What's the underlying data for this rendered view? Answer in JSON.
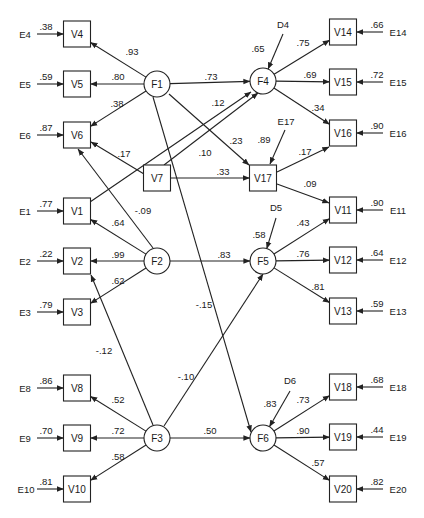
{
  "diagram": {
    "type": "structural-equation-path-diagram",
    "latent_factors": [
      "F1",
      "F2",
      "F3",
      "F4",
      "F5",
      "F6"
    ],
    "observed": [
      "V1",
      "V2",
      "V3",
      "V4",
      "V5",
      "V6",
      "V7",
      "V8",
      "V9",
      "V10",
      "V11",
      "V12",
      "V13",
      "V14",
      "V15",
      "V16",
      "V17",
      "V18",
      "V19",
      "V20"
    ],
    "nodes": [
      {
        "id": "F1",
        "shape": "circle"
      },
      {
        "id": "F2",
        "shape": "circle"
      },
      {
        "id": "F3",
        "shape": "circle"
      },
      {
        "id": "F4",
        "shape": "circle"
      },
      {
        "id": "F5",
        "shape": "circle"
      },
      {
        "id": "F6",
        "shape": "circle"
      },
      {
        "id": "V4",
        "shape": "box"
      },
      {
        "id": "V5",
        "shape": "box"
      },
      {
        "id": "V6",
        "shape": "box"
      },
      {
        "id": "V1",
        "shape": "box"
      },
      {
        "id": "V2",
        "shape": "box"
      },
      {
        "id": "V3",
        "shape": "box"
      },
      {
        "id": "V8",
        "shape": "box"
      },
      {
        "id": "V9",
        "shape": "box"
      },
      {
        "id": "V10",
        "shape": "box"
      },
      {
        "id": "V7",
        "shape": "box"
      },
      {
        "id": "V17",
        "shape": "box"
      },
      {
        "id": "V14",
        "shape": "box"
      },
      {
        "id": "V15",
        "shape": "box"
      },
      {
        "id": "V16",
        "shape": "box"
      },
      {
        "id": "V11",
        "shape": "box"
      },
      {
        "id": "V12",
        "shape": "box"
      },
      {
        "id": "V13",
        "shape": "box"
      },
      {
        "id": "V18",
        "shape": "box"
      },
      {
        "id": "V19",
        "shape": "box"
      },
      {
        "id": "V20",
        "shape": "box"
      }
    ],
    "paths": [
      {
        "from": "F1",
        "to": "V4",
        "coef": ".93"
      },
      {
        "from": "F1",
        "to": "V5",
        "coef": ".80"
      },
      {
        "from": "F1",
        "to": "V6",
        "coef": ".38"
      },
      {
        "from": "F1",
        "to": "F4",
        "coef": ".73"
      },
      {
        "from": "F1",
        "to": "V17",
        "coef": ".23"
      },
      {
        "from": "F1",
        "to": "F6",
        "coef": "-.15"
      },
      {
        "from": "V1",
        "to": "F4",
        "coef": ".12"
      },
      {
        "from": "V7",
        "to": "F4",
        "coef": ".10"
      },
      {
        "from": "V7",
        "to": "V6",
        "coef": ".17"
      },
      {
        "from": "V7",
        "to": "V17",
        "coef": ".33"
      },
      {
        "from": "F2",
        "to": "V6",
        "coef": "-.09"
      },
      {
        "from": "F2",
        "to": "V1",
        "coef": ".64"
      },
      {
        "from": "F2",
        "to": "V2",
        "coef": ".99"
      },
      {
        "from": "F2",
        "to": "V3",
        "coef": ".62"
      },
      {
        "from": "F2",
        "to": "F5",
        "coef": ".83"
      },
      {
        "from": "F3",
        "to": "V2",
        "coef": "-.12"
      },
      {
        "from": "F3",
        "to": "F5",
        "coef": "-.10"
      },
      {
        "from": "F3",
        "to": "V8",
        "coef": ".52"
      },
      {
        "from": "F3",
        "to": "V9",
        "coef": ".72"
      },
      {
        "from": "F3",
        "to": "V10",
        "coef": ".58"
      },
      {
        "from": "F3",
        "to": "F6",
        "coef": ".50"
      },
      {
        "from": "F4",
        "to": "V14",
        "coef": ".75"
      },
      {
        "from": "F4",
        "to": "V15",
        "coef": ".69"
      },
      {
        "from": "F4",
        "to": "V16",
        "coef": ".34"
      },
      {
        "from": "V17",
        "to": "V16",
        "coef": ".17"
      },
      {
        "from": "V17",
        "to": "V11",
        "coef": ".09"
      },
      {
        "from": "F5",
        "to": "V11",
        "coef": ".43"
      },
      {
        "from": "F5",
        "to": "V12",
        "coef": ".76"
      },
      {
        "from": "F5",
        "to": "V13",
        "coef": ".81"
      },
      {
        "from": "F6",
        "to": "V18",
        "coef": ".73"
      },
      {
        "from": "F6",
        "to": "V19",
        "coef": ".90"
      },
      {
        "from": "F6",
        "to": "V20",
        "coef": ".57"
      }
    ],
    "errors": [
      {
        "id": "E4",
        "to": "V4",
        "coef": ".38"
      },
      {
        "id": "E5",
        "to": "V5",
        "coef": ".59"
      },
      {
        "id": "E6",
        "to": "V6",
        "coef": ".87"
      },
      {
        "id": "E1",
        "to": "V1",
        "coef": ".77"
      },
      {
        "id": "E2",
        "to": "V2",
        "coef": ".22"
      },
      {
        "id": "E3",
        "to": "V3",
        "coef": ".79"
      },
      {
        "id": "E8",
        "to": "V8",
        "coef": ".86"
      },
      {
        "id": "E9",
        "to": "V9",
        "coef": ".70"
      },
      {
        "id": "E10",
        "to": "V10",
        "coef": ".81"
      },
      {
        "id": "E14",
        "to": "V14",
        "coef": ".66"
      },
      {
        "id": "E15",
        "to": "V15",
        "coef": ".72"
      },
      {
        "id": "E16",
        "to": "V16",
        "coef": ".90"
      },
      {
        "id": "E11",
        "to": "V11",
        "coef": ".90"
      },
      {
        "id": "E12",
        "to": "V12",
        "coef": ".64"
      },
      {
        "id": "E13",
        "to": "V13",
        "coef": ".59"
      },
      {
        "id": "E18",
        "to": "V18",
        "coef": ".68"
      },
      {
        "id": "E19",
        "to": "V19",
        "coef": ".44"
      },
      {
        "id": "E20",
        "to": "V20",
        "coef": ".82"
      },
      {
        "id": "E17",
        "to": "V17",
        "coef": ".89"
      }
    ],
    "disturbances": [
      {
        "id": "D4",
        "to": "F4",
        "coef": ".65"
      },
      {
        "id": "D5",
        "to": "F5",
        "coef": ".58"
      },
      {
        "id": "D6",
        "to": "F6",
        "coef": ".83"
      }
    ]
  }
}
